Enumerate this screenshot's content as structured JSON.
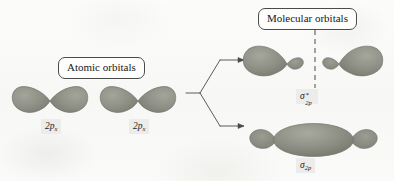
{
  "figure": {
    "background_color": "#fbfbfa"
  },
  "callouts": {
    "atomic": "Atomic orbitals",
    "molecular": "Molecular orbitals"
  },
  "colors": {
    "orbital_fill": "#8d8f84",
    "orbital_fill_light": "#9fa196",
    "orbital_fill_dark": "#777a6f",
    "orbital_stroke": "#6f7268",
    "line": "#4a4a48",
    "label_background": "#ececea",
    "text": "#17171a"
  },
  "atomic_orbitals": [
    {
      "name": "2p-x-left",
      "label_base": "2p",
      "label_sub": "x"
    },
    {
      "name": "2p-x-right",
      "label_base": "2p",
      "label_sub": "x"
    }
  ],
  "molecular_orbitals": [
    {
      "name": "sigma-star-2p",
      "type": "antibonding",
      "label_base": "σ",
      "label_sup": "*",
      "label_sub": "2p",
      "has_node": true,
      "node_style": "vertical-dashed"
    },
    {
      "name": "sigma-2p",
      "type": "bonding",
      "label_base": "σ",
      "label_sup": "",
      "label_sub": "2p",
      "has_node": false,
      "node_style": ""
    }
  ],
  "arrow": {
    "name": "branching-arrow",
    "branches": 2,
    "direction": "left-to-right"
  }
}
